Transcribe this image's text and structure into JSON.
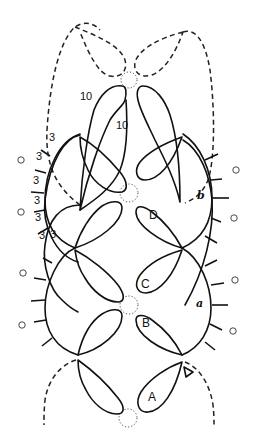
{
  "diagram": {
    "type": "tatting pattern diagram",
    "stroke_color": "#111111",
    "background": "#ffffff",
    "ring_labels": {
      "A": "A",
      "B": "B",
      "C": "C",
      "D": "D"
    },
    "chain_labels": {
      "a": "a",
      "b": "b"
    },
    "stitch_counts": {
      "top_ring_side_1": "10",
      "top_ring_side_2": "10",
      "chain_spaces": [
        "3",
        "3",
        "3",
        "3",
        "3",
        "3",
        "3"
      ]
    },
    "join_markers": [
      "o",
      "o",
      "o",
      "o",
      "o",
      "o",
      "o",
      "o"
    ]
  }
}
